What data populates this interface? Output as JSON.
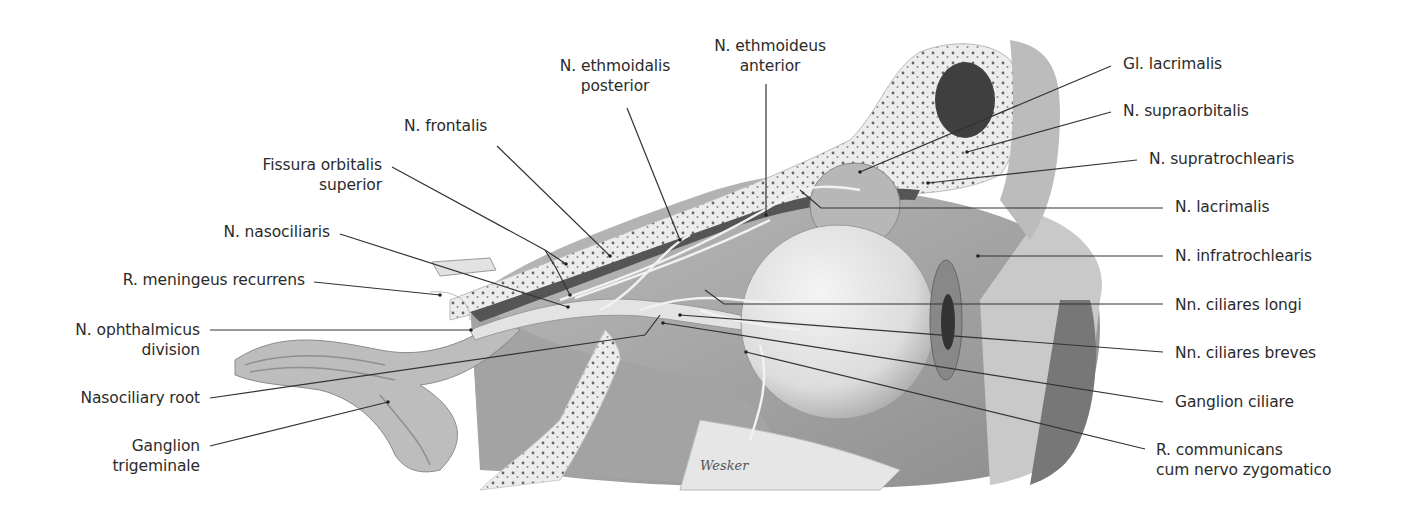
{
  "figure": {
    "type": "anatomical-illustration",
    "signature": "Wesker",
    "colors": {
      "background": "#ffffff",
      "text": "#2b2b2b",
      "leader": "#333333",
      "bone": "#e8e8e8",
      "tissue": "#9a9a9a",
      "eyeball": "#e4e4e4"
    }
  },
  "labels": {
    "n_ethmoideus_anterior": {
      "line1": "N. ethmoideus",
      "line2": "anterior"
    },
    "n_ethmoidalis_posterior": {
      "line1": "N. ethmoidalis",
      "line2": "posterior"
    },
    "n_frontalis": {
      "line1": "N. frontalis"
    },
    "fissura_orbitalis_superior": {
      "line1": "Fissura orbitalis",
      "line2": "superior"
    },
    "n_nasociliaris": {
      "line1": "N. nasociliaris"
    },
    "r_meningeus_recurrens": {
      "line1": "R. meningeus recurrens"
    },
    "n_ophthalmicus_division": {
      "line1": "N. ophthalmicus",
      "line2": "division"
    },
    "nasociliary_root": {
      "line1": "Nasociliary root"
    },
    "ganglion_trigeminale": {
      "line1": "Ganglion",
      "line2": "trigeminale"
    },
    "gl_lacrimalis": {
      "line1": "Gl. lacrimalis"
    },
    "n_supraorbitalis": {
      "line1": "N. supraorbitalis"
    },
    "n_supratrochlearis": {
      "line1": "N. supratrochlearis"
    },
    "n_lacrimalis": {
      "line1": "N. lacrimalis"
    },
    "n_infratrochlearis": {
      "line1": "N. infratrochlearis"
    },
    "nn_ciliares_longi": {
      "line1": "Nn. ciliares longi"
    },
    "nn_ciliares_breves": {
      "line1": "Nn. ciliares breves"
    },
    "ganglion_ciliare": {
      "line1": "Ganglion ciliare"
    },
    "r_communicans": {
      "line1": "R. communicans",
      "line2": "cum nervo zygomatico"
    }
  }
}
